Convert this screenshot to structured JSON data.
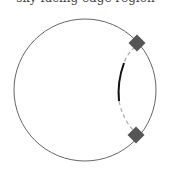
{
  "caption": {
    "text": "sky-facing edge region",
    "clipped": true
  },
  "diagram": {
    "outer_circle": {
      "cx": 85,
      "cy": 90,
      "r": 71,
      "stroke": "#666666"
    },
    "inner_arc": {
      "stroke": "#111111",
      "style": "solid"
    },
    "connectors": {
      "stroke": "#aaaaaa",
      "style": "dashed"
    },
    "markers": [
      {
        "shape": "diamond",
        "x": 137,
        "y": 43,
        "fill": "#555555"
      },
      {
        "shape": "diamond",
        "x": 136,
        "y": 135,
        "fill": "#555555"
      }
    ]
  }
}
